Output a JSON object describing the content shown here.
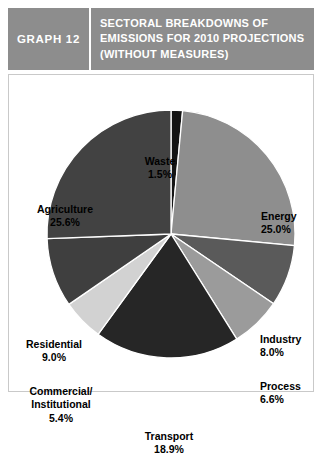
{
  "header": {
    "number_label": "GRAPH 12",
    "title": "SECTORAL BREAKDOWNS OF EMISSIONS FOR 2010 PROJECTIONS (WITHOUT MEASURES)",
    "band_color": "#8d8d8d",
    "text_color": "#ffffff"
  },
  "chart_data": {
    "type": "pie",
    "title": "SECTORAL BREAKDOWNS OF EMISSIONS FOR 2010 PROJECTIONS (WITHOUT MEASURES)",
    "xlabel": "",
    "ylabel": "",
    "units": "percent",
    "start_angle_deg": 0,
    "direction": "clockwise",
    "legend": "none (labels placed around pie)",
    "grid": false,
    "categories": [
      "Waste",
      "Energy",
      "Industry",
      "Process",
      "Transport",
      "Commercial/Institutional",
      "Residential",
      "Agriculture"
    ],
    "values": [
      1.5,
      25.0,
      8.0,
      6.6,
      18.9,
      5.4,
      9.0,
      25.6
    ],
    "colors": [
      "#141414",
      "#8e8e8e",
      "#5a5a5a",
      "#9b9b9b",
      "#262626",
      "#d2d2d2",
      "#3f3f3f",
      "#424242"
    ],
    "slices": [
      {
        "label": "Waste",
        "value": 1.5,
        "value_text": "1.5%",
        "color": "#141414"
      },
      {
        "label": "Energy",
        "value": 25.0,
        "value_text": "25.0%",
        "color": "#8e8e8e"
      },
      {
        "label": "Industry",
        "value": 8.0,
        "value_text": "8.0%",
        "color": "#5a5a5a"
      },
      {
        "label": "Process",
        "value": 6.6,
        "value_text": "6.6%",
        "color": "#9b9b9b"
      },
      {
        "label": "Transport",
        "value": 18.9,
        "value_text": "18.9%",
        "color": "#262626"
      },
      {
        "label": "Commercial/ Institutional",
        "value": 5.4,
        "value_text": "5.4%",
        "color": "#d2d2d2"
      },
      {
        "label": "Residential",
        "value": 9.0,
        "value_text": "9.0%",
        "color": "#3f3f3f"
      },
      {
        "label": "Agriculture",
        "value": 25.6,
        "value_text": "25.6%",
        "color": "#424242"
      }
    ]
  },
  "labels": {
    "waste": {
      "name": "Waste",
      "value": "1.5%"
    },
    "energy": {
      "name": "Energy",
      "value": "25.0%"
    },
    "industry": {
      "name": "Industry",
      "value": "8.0%"
    },
    "process": {
      "name": "Process",
      "value": "6.6%"
    },
    "transport": {
      "name": "Transport",
      "value": "18.9%"
    },
    "commercial": {
      "name_line1": "Commercial/",
      "name_line2": "Institutional",
      "value": "5.4%"
    },
    "residential": {
      "name": "Residential",
      "value": "9.0%"
    },
    "agriculture": {
      "name": "Agriculture",
      "value": "25.6%"
    }
  }
}
